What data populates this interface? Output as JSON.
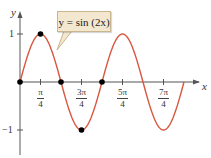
{
  "chart_data": {
    "type": "line",
    "title": "",
    "annotation": "y = sin(2x)",
    "xlabel": "x",
    "ylabel": "y",
    "function": "sin(2x)",
    "xlim": [
      0,
      6.2832
    ],
    "ylim": [
      -1,
      1
    ],
    "x_ticks": [
      {
        "value": 0.7854,
        "num": "π",
        "den": "4"
      },
      {
        "value": 2.3562,
        "num": "3π",
        "den": "4"
      },
      {
        "value": 3.927,
        "num": "5π",
        "den": "4"
      },
      {
        "value": 5.4978,
        "num": "7π",
        "den": "4"
      }
    ],
    "y_ticks": [
      {
        "value": 1,
        "label": "1"
      },
      {
        "value": -1,
        "label": "−1"
      }
    ],
    "marked_points": [
      {
        "x": 0,
        "y": 0
      },
      {
        "x": 0.7854,
        "y": 1
      },
      {
        "x": 1.5708,
        "y": 0
      },
      {
        "x": 2.3562,
        "y": -1
      },
      {
        "x": 3.1416,
        "y": 0
      }
    ],
    "grid": false,
    "colors": {
      "curve": "#d9573f",
      "axis": "#555555",
      "point": "#000000",
      "callout_fill": "#f3e8cf",
      "callout_border": "#c9b58e"
    }
  },
  "labels": {
    "y_axis": "y",
    "x_axis": "x",
    "callout": "y = sin (2x)"
  }
}
